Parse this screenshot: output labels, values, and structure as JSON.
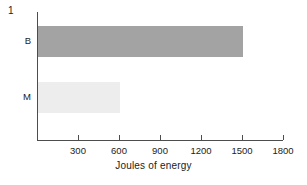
{
  "figure": {
    "panel_label": "1"
  },
  "chart_data": {
    "type": "bar",
    "orientation": "horizontal",
    "title": "",
    "subtitle": "",
    "xlabel": "Joules of energy",
    "ylabel": "",
    "categories": [
      "B",
      "M"
    ],
    "values": [
      1500,
      600
    ],
    "series": [
      {
        "name": "Joules of energy",
        "values": [
          1500,
          600
        ]
      }
    ],
    "bars": [
      {
        "category": "B",
        "value": 1500,
        "color": "#a3a3a3"
      },
      {
        "category": "M",
        "value": 600,
        "color": "#ededed"
      }
    ],
    "xlim": [
      0,
      1800
    ],
    "xticks": [
      0,
      300,
      600,
      900,
      1200,
      1500,
      1800
    ],
    "xtick_labels": [
      "",
      "300",
      "600",
      "900",
      "1200",
      "1500",
      "1800"
    ],
    "ytick_labels": [
      "B",
      "M"
    ],
    "grid": false,
    "legend": null,
    "annotations": [
      "1"
    ],
    "colors": {
      "bar_b": "#a3a3a3",
      "bar_m": "#ededed",
      "axis": "#4d4d4d",
      "text": "#222222",
      "background": "#ffffff"
    }
  }
}
